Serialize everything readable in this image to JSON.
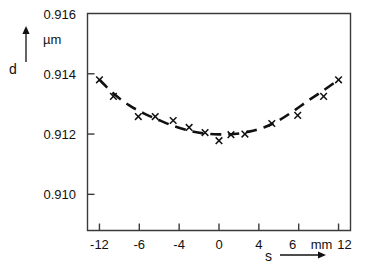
{
  "chart_data": {
    "type": "line",
    "title": "",
    "subtitle": "",
    "xlabel": "s",
    "ylabel": "d",
    "y_unit": "µm",
    "x_unit": "mm",
    "xlim": [
      -13.2,
      13.2
    ],
    "ylim": [
      0.9088,
      0.916
    ],
    "grid": false,
    "legend": null,
    "y_tick_labels": [
      "0.916",
      "0.914",
      "0.912",
      "0.910"
    ],
    "y_tick_values": [
      0.916,
      0.914,
      0.912,
      0.91
    ],
    "x_tick_labels": [
      "-12",
      "-6",
      "-4",
      "0",
      "4",
      "6",
      "12"
    ],
    "x_tick_values": [
      -12,
      -8,
      -4,
      0,
      4,
      8,
      12
    ],
    "x_unit_note": "mm",
    "series": [
      {
        "name": "d(s)",
        "style": "dashed-fit-curve",
        "marker": "x",
        "x": [
          -12.0,
          -10.6,
          -8.1,
          -6.4,
          -4.6,
          -3.0,
          -1.4,
          0.0,
          1.2,
          2.6,
          5.3,
          7.9,
          10.5,
          12.0
        ],
        "y": [
          0.9138,
          0.91325,
          0.91258,
          0.91258,
          0.91245,
          0.91222,
          0.91205,
          0.91178,
          0.91198,
          0.912,
          0.91235,
          0.91262,
          0.91325,
          0.9138
        ]
      }
    ],
    "fit_curve": {
      "description": "dashed parabolic fit through the x markers, minimum near s = 1",
      "x": [
        -12.0,
        -10.5,
        -9.0,
        -7.5,
        -6.0,
        -4.5,
        -3.0,
        -1.5,
        0.0,
        1.5,
        3.0,
        4.5,
        6.0,
        7.5,
        9.0,
        10.5,
        12.0
      ],
      "y": [
        0.9138,
        0.91332,
        0.91295,
        0.91268,
        0.91246,
        0.91226,
        0.91211,
        0.91202,
        0.91199,
        0.912,
        0.91208,
        0.91222,
        0.91245,
        0.91277,
        0.91312,
        0.91345,
        0.9138
      ]
    },
    "annotations": {
      "y_axis_arrow": "up",
      "x_axis_arrow": "right"
    }
  },
  "axis": {
    "y_letter": "d",
    "x_letter": "s",
    "unit_label": "µm",
    "mm_label": "mm"
  }
}
